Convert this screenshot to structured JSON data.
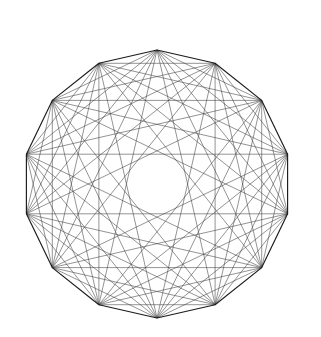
{
  "figure": {
    "type": "complete-graph-polygon",
    "background_color": "#ffffff",
    "line_color": "#3a3a3a",
    "perimeter_color": "#1a1a1a",
    "chord_stroke_width": 0.55,
    "perimeter_stroke_width": 1.15,
    "vertex_count": 14,
    "center_x": 157,
    "center_y": 184,
    "radius": 134,
    "start_angle_deg": 90,
    "direction": "clockwise",
    "center_hole_radius": 19,
    "draw_diameters": false
  },
  "chart_data": {
    "type": "scatter",
    "subtitle": "",
    "xlabel": "",
    "ylabel": "",
    "grid": false,
    "legend": "none",
    "xlim": [
      0,
      321
    ],
    "ylim": [
      0,
      337
    ],
    "vertex_count": 14,
    "edge_count": 84,
    "skipped_edges": "7 long diagonals (diameters) omitted, producing the central hole",
    "vertices": [
      {
        "index": 0,
        "angle_deg": 90,
        "x": 157.0,
        "y": 50.0
      },
      {
        "index": 1,
        "angle_deg": 64.29,
        "x": 215.1,
        "y": 63.3
      },
      {
        "index": 2,
        "angle_deg": 38.57,
        "x": 261.7,
        "y": 100.4
      },
      {
        "index": 3,
        "angle_deg": 12.86,
        "x": 287.6,
        "y": 154.2
      },
      {
        "index": 4,
        "angle_deg": -12.86,
        "x": 287.6,
        "y": 213.8
      },
      {
        "index": 5,
        "angle_deg": -38.57,
        "x": 261.7,
        "y": 267.6
      },
      {
        "index": 6,
        "angle_deg": -64.29,
        "x": 215.1,
        "y": 304.7
      },
      {
        "index": 7,
        "angle_deg": -90,
        "x": 157.0,
        "y": 318.0
      },
      {
        "index": 8,
        "angle_deg": -115.7,
        "x": 98.9,
        "y": 304.7
      },
      {
        "index": 9,
        "angle_deg": -141.4,
        "x": 52.3,
        "y": 267.6
      },
      {
        "index": 10,
        "angle_deg": -167.1,
        "x": 26.4,
        "y": 213.8
      },
      {
        "index": 11,
        "angle_deg": 167.14,
        "x": 26.4,
        "y": 154.2
      },
      {
        "index": 12,
        "angle_deg": 141.43,
        "x": 52.3,
        "y": 100.4
      },
      {
        "index": 13,
        "angle_deg": 115.71,
        "x": 98.9,
        "y": 63.3
      }
    ]
  }
}
